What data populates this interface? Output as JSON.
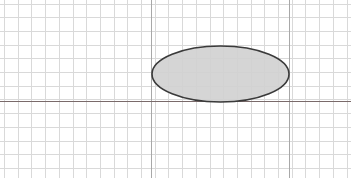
{
  "canvas": {
    "width": 351,
    "height": 178,
    "background": "#ffffff"
  },
  "grid": {
    "minor_spacing": 13.7,
    "origin_x": 4,
    "origin_y": 3.5,
    "minor_color": "#d9d9d9",
    "major_color": "#a8a8a8",
    "major_vertical_x": [
      151,
      289
    ],
    "vertical_count": 26,
    "horizontal_count": 13
  },
  "axis": {
    "y": 101.5,
    "color": "#7a6a6a"
  },
  "ellipse": {
    "cx": 220.5,
    "cy": 74,
    "rx": 68.5,
    "ry": 28,
    "fill": "#d0d0d0",
    "stroke": "#3a3a3a",
    "stroke_width": 1.6
  }
}
